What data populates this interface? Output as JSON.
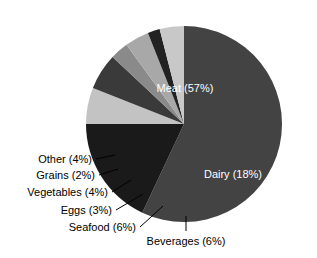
{
  "chart_data": {
    "type": "pie",
    "title": "",
    "subtitle": "",
    "xlabel": "",
    "ylabel": "",
    "legend_position": "none",
    "grid": false,
    "units": "percent",
    "total": 100,
    "categories": [
      "Meat",
      "Dairy",
      "Beverages",
      "Seafood",
      "Eggs",
      "Vegetables",
      "Grains",
      "Other"
    ],
    "values": [
      57,
      18,
      6,
      6,
      3,
      4,
      2,
      4
    ],
    "slices": [
      {
        "name": "Meat",
        "value": 57,
        "label": "Meat (57%)",
        "color": "#434343",
        "label_placement": "inside",
        "label_x": 185,
        "label_y": 92,
        "anchor": "middle",
        "text_color": "#ffffff"
      },
      {
        "name": "Dairy",
        "value": 18,
        "label": "Dairy (18%)",
        "color": "#1a1a1a",
        "label_placement": "inside",
        "label_y": 178,
        "label_x": 233,
        "anchor": "middle",
        "text_color": "#ffffff"
      },
      {
        "name": "Beverages",
        "value": 6,
        "label": "Beverages (6%)",
        "color": "#c3c3c3",
        "label_placement": "outside",
        "label_x": 186,
        "label_y": 245,
        "anchor": "middle",
        "text_color": "#000000",
        "leader": "M 186 231 L 186 216"
      },
      {
        "name": "Seafood",
        "value": 6,
        "label": "Seafood (6%)",
        "color": "#3a3a3a",
        "label_placement": "outside",
        "label_x": 136,
        "label_y": 231,
        "anchor": "end",
        "text_color": "#000000",
        "leader": "M 140 227 L 163 206"
      },
      {
        "name": "Eggs",
        "value": 3,
        "label": "Eggs (3%)",
        "color": "#8a8a8a",
        "label_placement": "outside",
        "label_x": 112,
        "label_y": 214,
        "anchor": "end",
        "text_color": "#000000",
        "leader": "M 116 210 L 143 194"
      },
      {
        "name": "Vegetables",
        "value": 4,
        "label": "Vegetables (4%)",
        "color": "#a8a8a8",
        "label_placement": "outside",
        "label_x": 108,
        "label_y": 196,
        "anchor": "end",
        "text_color": "#000000",
        "leader": "M 112 192 L 131 180"
      },
      {
        "name": "Grains",
        "value": 2,
        "label": "Grains (2%)",
        "color": "#222222",
        "label_placement": "outside",
        "label_x": 95,
        "label_y": 179,
        "anchor": "end",
        "text_color": "#000000",
        "leader": "M 99 175 L 118 169"
      },
      {
        "name": "Other",
        "value": 4,
        "label": "Other (4%)",
        "color": "#c8c8c8",
        "label_placement": "outside",
        "label_x": 92,
        "label_y": 163,
        "anchor": "end",
        "text_color": "#000000",
        "leader": "M 96 159 L 115 155"
      }
    ],
    "geometry": {
      "center_x": 184,
      "center_y": 124,
      "radius": 98,
      "start_angle_deg": -90,
      "direction": "clockwise"
    }
  }
}
